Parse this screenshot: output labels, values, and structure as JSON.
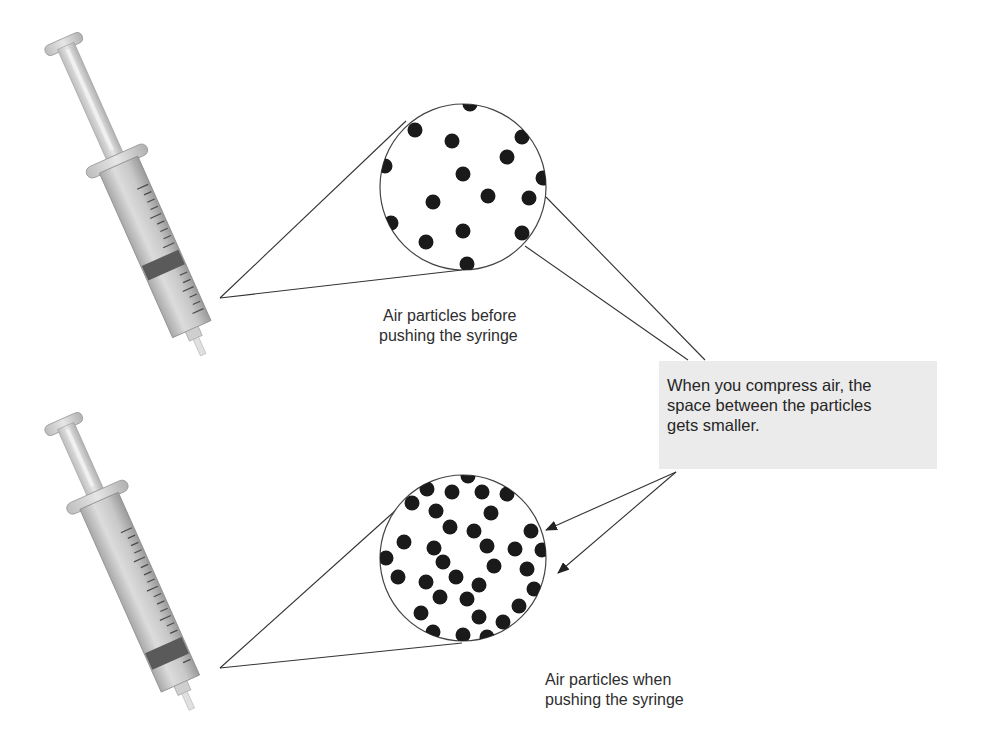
{
  "diagram": {
    "top_panel": {
      "syringe_state": "plunger pulled back",
      "caption_lines": [
        "Air particles before",
        "pushing the syringe"
      ],
      "circle": {
        "cx": 463,
        "cy": 187,
        "r": 83
      },
      "particles": [
        [
          470,
          104
        ],
        [
          415,
          130
        ],
        [
          452,
          141
        ],
        [
          522,
          137
        ],
        [
          507,
          157
        ],
        [
          385,
          166
        ],
        [
          463,
          174
        ],
        [
          543,
          178
        ],
        [
          433,
          202
        ],
        [
          488,
          196
        ],
        [
          529,
          198
        ],
        [
          391,
          223
        ],
        [
          463,
          231
        ],
        [
          426,
          242
        ],
        [
          522,
          233
        ],
        [
          467,
          264
        ]
      ]
    },
    "bottom_panel": {
      "syringe_state": "plunger pushed in",
      "caption_lines": [
        "Air particles when",
        "pushing the syringe"
      ],
      "circle": {
        "cx": 463,
        "cy": 558,
        "r": 83
      },
      "particles": [
        [
          468,
          476
        ],
        [
          427,
          489
        ],
        [
          452,
          492
        ],
        [
          482,
          492
        ],
        [
          507,
          494
        ],
        [
          412,
          503
        ],
        [
          436,
          511
        ],
        [
          491,
          513
        ],
        [
          450,
          527
        ],
        [
          474,
          531
        ],
        [
          531,
          531
        ],
        [
          404,
          542
        ],
        [
          434,
          548
        ],
        [
          487,
          546
        ],
        [
          515,
          549
        ],
        [
          542,
          550
        ],
        [
          386,
          558
        ],
        [
          443,
          562
        ],
        [
          494,
          566
        ],
        [
          527,
          569
        ],
        [
          398,
          577
        ],
        [
          426,
          582
        ],
        [
          456,
          577
        ],
        [
          479,
          585
        ],
        [
          534,
          589
        ],
        [
          440,
          597
        ],
        [
          467,
          599
        ],
        [
          519,
          606
        ],
        [
          421,
          613
        ],
        [
          479,
          617
        ],
        [
          503,
          622
        ],
        [
          433,
          632
        ],
        [
          463,
          635
        ],
        [
          487,
          637
        ]
      ]
    },
    "callout": {
      "lines": [
        "When you compress air, the",
        "space between the particles",
        "gets smaller."
      ],
      "background": "#ebebeb"
    },
    "colors": {
      "particle": "#1a1a1a",
      "line": "#333333"
    }
  }
}
